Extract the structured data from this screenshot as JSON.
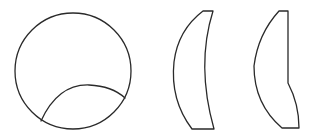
{
  "figure": {
    "background": "#ffffff",
    "stroke_color": "#2a2a2a",
    "shapes": [
      {
        "name": "circle-with-inner-arc",
        "circle": {
          "cx": 73,
          "cy": 71,
          "r": 58
        },
        "inner_arc": {
          "start": [
            41,
            121
          ],
          "peak": [
            89,
            85
          ],
          "end": [
            125,
            98
          ]
        }
      },
      {
        "name": "crescent-lens-shape",
        "top": [
          [
            203,
            11
          ],
          [
            213,
            11
          ]
        ],
        "bottom": [
          [
            192,
            129
          ],
          [
            214,
            129
          ]
        ],
        "outer_bulge_x": 174,
        "inner_curve_x": 202
      },
      {
        "name": "half-lens-shape",
        "top": [
          [
            279,
            11
          ],
          [
            288,
            11
          ]
        ],
        "straight_edge_end": [
          288,
          83
        ],
        "bottom": [
          [
            282,
            128
          ],
          [
            299,
            128
          ]
        ],
        "outer_bulge_x": 254
      }
    ]
  }
}
